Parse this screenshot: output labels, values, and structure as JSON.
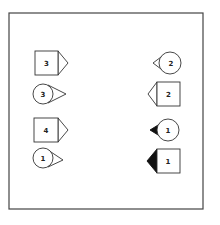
{
  "diagram": {
    "frame": {
      "x": 9,
      "y": 13,
      "width": 194,
      "height": 196,
      "stroke": "#444444"
    },
    "colors": {
      "stroke": "#333333",
      "fill": "#ffffff",
      "filled_pointer": "#111111"
    },
    "left_column": [
      {
        "shape": "square",
        "label": "3",
        "pointer": "right",
        "pointer_filled": false
      },
      {
        "shape": "circle",
        "label": "3",
        "pointer": "right",
        "pointer_filled": false
      },
      {
        "shape": "square",
        "label": "4",
        "pointer": "right",
        "pointer_filled": false
      },
      {
        "shape": "circle",
        "label": "1",
        "pointer": "right",
        "pointer_filled": false
      }
    ],
    "right_column": [
      {
        "shape": "circle",
        "label": "2",
        "pointer": "left",
        "pointer_filled": false
      },
      {
        "shape": "square",
        "label": "2",
        "pointer": "left",
        "pointer_filled": false
      },
      {
        "shape": "circle",
        "label": "1",
        "pointer": "left",
        "pointer_filled": true
      },
      {
        "shape": "square",
        "label": "1",
        "pointer": "left",
        "pointer_filled": true
      }
    ]
  }
}
